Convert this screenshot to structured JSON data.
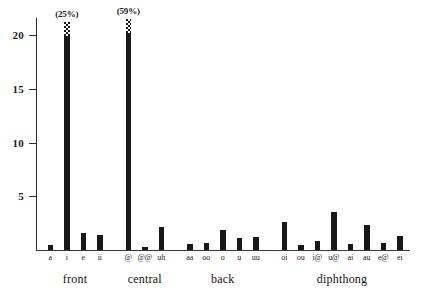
{
  "chart_data": {
    "type": "bar",
    "title": "",
    "xlabel": "",
    "ylabel": "",
    "ylim": [
      0,
      22
    ],
    "grid": false,
    "legend": null,
    "y_ticks": [
      5,
      10,
      15,
      20
    ],
    "y_tick_labels": [
      "5",
      "10",
      "15",
      "20"
    ],
    "categories": [
      "a",
      "i",
      "e",
      "ii",
      "@",
      "@@",
      "uh",
      "aa",
      "oo",
      "o",
      "u",
      "uu",
      "oi",
      "ou",
      "i@",
      "u@",
      "ai",
      "au",
      "e@",
      "ei"
    ],
    "values": [
      0.5,
      25.0,
      1.6,
      1.4,
      59.0,
      0.3,
      2.1,
      0.6,
      0.7,
      1.9,
      1.1,
      1.2,
      2.6,
      0.5,
      0.8,
      3.5,
      0.6,
      2.3,
      0.7,
      1.3
    ],
    "truncated_bars": [
      {
        "category": "i",
        "index": 1,
        "label": "(25%)",
        "drawn_to": 21.3
      },
      {
        "category": "@",
        "index": 4,
        "label": "(59%)",
        "drawn_to": 21.5
      }
    ],
    "groups": [
      {
        "label": "front",
        "categories": [
          "a",
          "i",
          "e",
          "ii"
        ]
      },
      {
        "label": "central",
        "categories": [
          "@",
          "@@",
          "uh"
        ]
      },
      {
        "label": "back",
        "categories": [
          "aa",
          "oo",
          "o",
          "u",
          "uu"
        ]
      },
      {
        "label": "diphthong",
        "categories": [
          "oi",
          "ou",
          "i@",
          "u@",
          "ai",
          "au",
          "e@",
          "ei"
        ]
      }
    ],
    "bar_color": "#181818",
    "axis_color": "#2a2a2a"
  }
}
